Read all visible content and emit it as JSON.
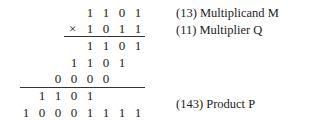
{
  "times_symbol": "×",
  "rows": [
    {
      "name": "multiplicand",
      "digits": [
        "1",
        "1",
        "0",
        "1"
      ],
      "shift": 0
    },
    {
      "name": "multiplier",
      "digits": [
        "1",
        "0",
        "1",
        "1"
      ],
      "shift": 0
    },
    {
      "name": "partial-product-1",
      "digits": [
        "1",
        "1",
        "0",
        "1"
      ],
      "shift": 0
    },
    {
      "name": "partial-product-2",
      "digits": [
        "1",
        "1",
        "0",
        "1"
      ],
      "shift": 1
    },
    {
      "name": "partial-product-3",
      "digits": [
        "0",
        "0",
        "0",
        "0"
      ],
      "shift": 2
    },
    {
      "name": "partial-product-4",
      "digits": [
        "1",
        "1",
        "0",
        "1"
      ],
      "shift": 3
    },
    {
      "name": "product",
      "digits": [
        "1",
        "0",
        "0",
        "0",
        "1",
        "1",
        "1",
        "1"
      ],
      "shift": 0
    }
  ],
  "labels": {
    "multiplicand": "(13)  Multiplicand M",
    "multiplier": "(11)  Multiplier Q",
    "product": "(143)  Product P"
  }
}
